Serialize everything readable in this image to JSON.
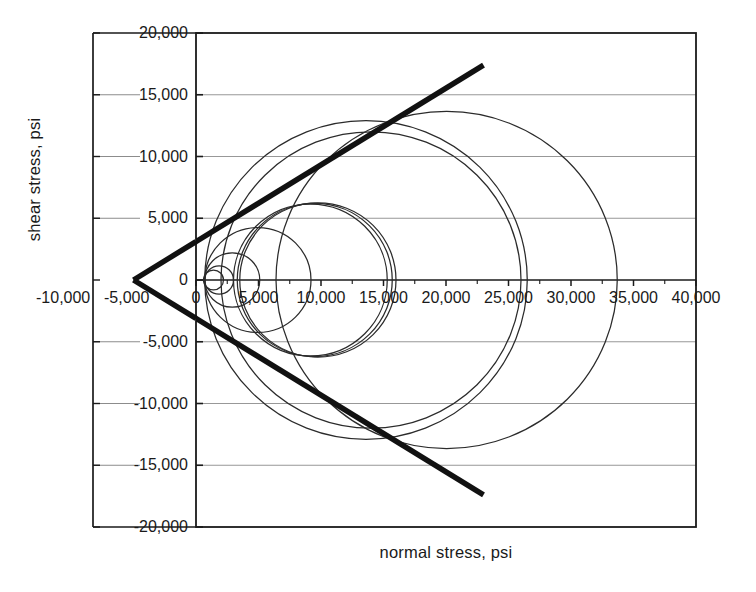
{
  "chart_data": {
    "type": "line",
    "title": "",
    "xlabel": "normal stress, psi",
    "ylabel": "shear stress, psi",
    "xlim": [
      0,
      40000
    ],
    "ylim": [
      -20000,
      20000
    ],
    "grid": true,
    "legend": "none",
    "x_ticks": [
      0,
      5000,
      10000,
      15000,
      20000,
      25000,
      30000,
      35000,
      40000
    ],
    "x_tick_labels": [
      "0",
      "5,000",
      "10,000",
      "15,000",
      "20,000",
      "25,000",
      "30,000",
      "35,000",
      "40,000"
    ],
    "y_ticks": [
      20000,
      15000,
      10000,
      5000,
      0,
      -5000,
      -10000,
      -15000,
      -20000
    ],
    "y_tick_labels": [
      "20,000",
      "15,000",
      "10,000",
      "5,000",
      "0",
      "-5,000",
      "-10,000",
      "-15,000",
      "-20,000"
    ],
    "extra_axis_labels": [
      "-10,000",
      "-5,000"
    ],
    "series": [
      {
        "name": "Mohr circle 1",
        "type": "circle",
        "sigma1": 2200,
        "sigma3": 600,
        "center": 1400,
        "radius": 800
      },
      {
        "name": "Mohr circle 2",
        "type": "circle",
        "sigma1": 3000,
        "sigma3": 700,
        "center": 1850,
        "radius": 1150
      },
      {
        "name": "Mohr circle 3",
        "type": "circle",
        "sigma1": 5100,
        "sigma3": 700,
        "center": 2900,
        "radius": 2200
      },
      {
        "name": "Mohr circle 4",
        "type": "circle",
        "sigma1": 9200,
        "sigma3": 700,
        "center": 4950,
        "radius": 4250
      },
      {
        "name": "Mohr circle 5",
        "type": "circle",
        "sigma1": 15300,
        "sigma3": 3000,
        "center": 9150,
        "radius": 6150
      },
      {
        "name": "Mohr circle 6",
        "type": "circle",
        "sigma1": 15700,
        "sigma3": 3300,
        "center": 9500,
        "radius": 6200
      },
      {
        "name": "Mohr circle 7",
        "type": "circle",
        "sigma1": 16000,
        "sigma3": 3500,
        "center": 9750,
        "radius": 6250
      },
      {
        "name": "Mohr circle 8",
        "type": "circle",
        "sigma1": 26000,
        "sigma3": 2000,
        "center": 14000,
        "radius": 12000
      },
      {
        "name": "Mohr circle 9",
        "type": "circle",
        "sigma1": 26500,
        "sigma3": 700,
        "center": 13600,
        "radius": 12900
      },
      {
        "name": "Mohr circle 10",
        "type": "circle",
        "sigma1": 33700,
        "sigma3": 6400,
        "center": 20050,
        "radius": 13650
      },
      {
        "name": "Failure envelope (upper)",
        "type": "line",
        "x_start": -5000,
        "y_start": 0,
        "x_end": 23000,
        "y_end": 17400
      },
      {
        "name": "Failure envelope (lower)",
        "type": "line",
        "x_start": -5000,
        "y_start": 0,
        "x_end": 23000,
        "y_end": -17400
      }
    ]
  },
  "axes": {
    "y_title": "shear stress, psi",
    "x_title": "normal stress, psi",
    "y_labels": [
      "20,000",
      "15,000",
      "10,000",
      "5,000",
      "0",
      "-5,000",
      "-10,000",
      "-15,000",
      "-20,000"
    ],
    "x_labels": [
      "0",
      "5,000",
      "10,000",
      "15,000",
      "20,000",
      "25,000",
      "30,000",
      "35,000",
      "40,000"
    ],
    "left_axis_labels": [
      "-10,000",
      "-5,000"
    ]
  },
  "colors": {
    "axis": "#1a1a1a",
    "grid": "#8c8c8c",
    "circle": "#2b2b2b",
    "envelope": "#111111",
    "background": "#ffffff"
  }
}
